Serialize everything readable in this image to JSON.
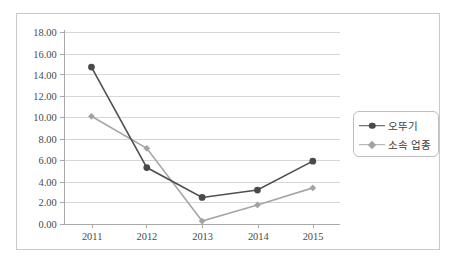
{
  "chart_data": {
    "type": "line",
    "title": "",
    "xlabel": "",
    "ylabel": "",
    "categories": [
      "2011",
      "2012",
      "2013",
      "2014",
      "2015"
    ],
    "ylim": [
      0.0,
      18.0
    ],
    "ytick_step": 2.0,
    "ytick_labels": [
      "0.00",
      "2.00",
      "4.00",
      "6.00",
      "8.00",
      "10.00",
      "12.00",
      "14.00",
      "16.00",
      "18.00"
    ],
    "grid": true,
    "legend_position": "right",
    "series": [
      {
        "name": "오뚜기",
        "marker": "circle",
        "color": "#4a4a4a",
        "line_color": "#4f4f4f",
        "values": [
          14.7,
          5.3,
          2.5,
          3.2,
          5.9
        ]
      },
      {
        "name": "소속 업종",
        "marker": "diamond",
        "color": "#a3a3a3",
        "line_color": "#a6a6a6",
        "values": [
          10.1,
          7.1,
          0.3,
          1.8,
          3.4
        ]
      }
    ]
  },
  "legend": {
    "items": [
      {
        "label": "오뚜기"
      },
      {
        "label": "소속 업종"
      }
    ]
  },
  "colors": {
    "series_a": "#4a4a4a",
    "series_b": "#a3a3a3",
    "gridline": "#d6d6d6",
    "axis": "#a8a8a8",
    "frame_border": "#c9c9c9",
    "background": "#ffffff"
  }
}
